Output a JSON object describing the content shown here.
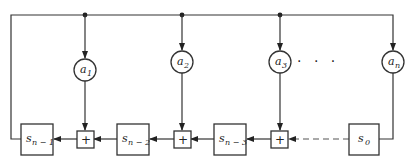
{
  "diagram": {
    "coefficients": [
      {
        "id": "a1",
        "base": "a",
        "sub": "1"
      },
      {
        "id": "a2",
        "base": "a",
        "sub": "2"
      },
      {
        "id": "a3",
        "base": "a",
        "sub": "3"
      },
      {
        "id": "an",
        "base": "a",
        "sub": "n"
      }
    ],
    "registers": [
      {
        "id": "s_n-1",
        "base": "s",
        "sub": "n − 1"
      },
      {
        "id": "s_n-2",
        "base": "s",
        "sub": "n − 2"
      },
      {
        "id": "s_n-3",
        "base": "s",
        "sub": "n − 3"
      },
      {
        "id": "s_0",
        "base": "s",
        "sub": "0"
      }
    ],
    "adders": [
      {
        "id": "add1",
        "symbol": "+"
      },
      {
        "id": "add2",
        "symbol": "+"
      },
      {
        "id": "add3",
        "symbol": "+"
      }
    ],
    "ellipsis": "· · ·",
    "colors": {
      "line": "#333333",
      "background": "#ffffff"
    }
  }
}
